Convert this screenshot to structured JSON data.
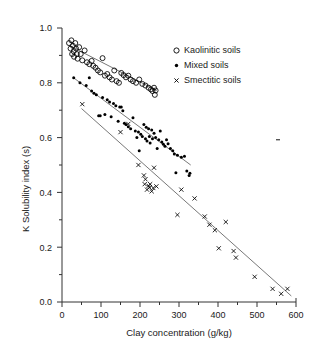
{
  "chart_data": {
    "type": "scatter",
    "title": "",
    "xlabel": "Clay concentration (g/kg)",
    "ylabel": "K Solubility index (s)",
    "xlim": [
      0,
      600
    ],
    "ylim": [
      0.0,
      1.0
    ],
    "xticks": [
      0,
      100,
      200,
      300,
      400,
      500,
      600
    ],
    "xtick_labels": [
      "0",
      "100",
      "200",
      "300",
      "400",
      "500",
      "600"
    ],
    "yticks": [
      0.0,
      0.2,
      0.4,
      0.6,
      0.8,
      1.0
    ],
    "ytick_labels": [
      "0.0",
      "0.2",
      "0.4",
      "0.6",
      "0.8",
      "1.0"
    ],
    "minor_xticks": [
      50,
      150,
      250,
      350,
      450,
      550
    ],
    "minor_yticks": [
      0.1,
      0.3,
      0.5,
      0.7,
      0.9
    ],
    "grid": false,
    "legend_position": "top-right",
    "series": [
      {
        "name": "Kaolinitic soils",
        "marker": "open-circle",
        "color": "#000000",
        "points": [
          [
            18,
            0.945
          ],
          [
            22,
            0.925
          ],
          [
            24,
            0.955
          ],
          [
            26,
            0.905
          ],
          [
            28,
            0.935
          ],
          [
            30,
            0.915
          ],
          [
            31,
            0.895
          ],
          [
            34,
            0.945
          ],
          [
            36,
            0.925
          ],
          [
            38,
            0.905
          ],
          [
            40,
            0.888
          ],
          [
            44,
            0.93
          ],
          [
            48,
            0.905
          ],
          [
            52,
            0.882
          ],
          [
            58,
            0.918
          ],
          [
            64,
            0.875
          ],
          [
            70,
            0.868
          ],
          [
            76,
            0.88
          ],
          [
            80,
            0.862
          ],
          [
            86,
            0.855
          ],
          [
            92,
            0.845
          ],
          [
            98,
            0.838
          ],
          [
            104,
            0.89
          ],
          [
            110,
            0.826
          ],
          [
            116,
            0.832
          ],
          [
            122,
            0.82
          ],
          [
            128,
            0.812
          ],
          [
            134,
            0.845
          ],
          [
            140,
            0.806
          ],
          [
            146,
            0.8
          ],
          [
            152,
            0.836
          ],
          [
            158,
            0.828
          ],
          [
            164,
            0.82
          ],
          [
            170,
            0.826
          ],
          [
            176,
            0.812
          ],
          [
            182,
            0.806
          ],
          [
            190,
            0.8
          ],
          [
            198,
            0.812
          ],
          [
            206,
            0.796
          ],
          [
            214,
            0.79
          ],
          [
            222,
            0.782
          ],
          [
            228,
            0.776
          ],
          [
            232,
            0.77
          ],
          [
            236,
            0.782
          ],
          [
            238,
            0.756
          ],
          [
            240,
            0.772
          ]
        ],
        "fit_line": {
          "x": [
            20,
            243
          ],
          "y": [
            0.935,
            0.772
          ]
        }
      },
      {
        "name": "Mixed soils",
        "marker": "filled-dot",
        "color": "#000000",
        "points": [
          [
            30,
            0.818
          ],
          [
            46,
            0.8
          ],
          [
            62,
            0.79
          ],
          [
            70,
            0.818
          ],
          [
            76,
            0.77
          ],
          [
            82,
            0.762
          ],
          [
            88,
            0.756
          ],
          [
            94,
            0.68
          ],
          [
            98,
            0.68
          ],
          [
            104,
            0.746
          ],
          [
            110,
            0.684
          ],
          [
            116,
            0.738
          ],
          [
            122,
            0.73
          ],
          [
            126,
            0.676
          ],
          [
            132,
            0.724
          ],
          [
            138,
            0.716
          ],
          [
            144,
            0.66
          ],
          [
            148,
            0.712
          ],
          [
            152,
            0.712
          ],
          [
            156,
            0.698
          ],
          [
            160,
            0.652
          ],
          [
            164,
            0.648
          ],
          [
            170,
            0.64
          ],
          [
            176,
            0.632
          ],
          [
            182,
            0.672
          ],
          [
            188,
            0.624
          ],
          [
            192,
            0.6
          ],
          [
            196,
            0.62
          ],
          [
            198,
            0.552
          ],
          [
            202,
            0.612
          ],
          [
            206,
            0.604
          ],
          [
            210,
            0.648
          ],
          [
            214,
            0.596
          ],
          [
            216,
            0.638
          ],
          [
            218,
            0.588
          ],
          [
            222,
            0.632
          ],
          [
            224,
            0.604
          ],
          [
            226,
            0.58
          ],
          [
            230,
            0.628
          ],
          [
            232,
            0.596
          ],
          [
            236,
            0.616
          ],
          [
            240,
            0.6
          ],
          [
            244,
            0.56
          ],
          [
            248,
            0.592
          ],
          [
            252,
            0.624
          ],
          [
            256,
            0.584
          ],
          [
            260,
            0.576
          ],
          [
            264,
            0.568
          ],
          [
            268,
            0.592
          ],
          [
            272,
            0.578
          ],
          [
            278,
            0.56
          ],
          [
            284,
            0.552
          ],
          [
            288,
            0.54
          ],
          [
            292,
            0.472
          ],
          [
            296,
            0.536
          ],
          [
            306,
            0.528
          ],
          [
            314,
            0.532
          ],
          [
            320,
            0.478
          ],
          [
            326,
            0.462
          ],
          [
            328,
            0.47
          ]
        ],
        "fit_line": {
          "x": [
            30,
            330
          ],
          "y": [
            0.818,
            0.5
          ]
        }
      },
      {
        "name": "Smectitic soils",
        "marker": "cross-x",
        "color": "#000000",
        "points": [
          [
            52,
            0.722
          ],
          [
            150,
            0.62
          ],
          [
            170,
            0.65
          ],
          [
            196,
            0.5
          ],
          [
            210,
            0.462
          ],
          [
            212,
            0.43
          ],
          [
            214,
            0.448
          ],
          [
            218,
            0.41
          ],
          [
            222,
            0.424
          ],
          [
            224,
            0.418
          ],
          [
            226,
            0.43
          ],
          [
            230,
            0.404
          ],
          [
            234,
            0.416
          ],
          [
            236,
            0.49
          ],
          [
            242,
            0.422
          ],
          [
            296,
            0.318
          ],
          [
            306,
            0.41
          ],
          [
            340,
            0.378
          ],
          [
            366,
            0.312
          ],
          [
            378,
            0.282
          ],
          [
            392,
            0.262
          ],
          [
            402,
            0.196
          ],
          [
            420,
            0.292
          ],
          [
            440,
            0.186
          ],
          [
            446,
            0.162
          ],
          [
            494,
            0.092
          ],
          [
            540,
            0.048
          ],
          [
            562,
            0.03
          ],
          [
            578,
            0.048
          ]
        ],
        "fit_line": {
          "x": [
            50,
            588
          ],
          "y": [
            0.706,
            0.022
          ]
        }
      }
    ]
  },
  "legend": {
    "items": [
      {
        "label": "Kaolinitic soils",
        "marker": "open-circle"
      },
      {
        "label": "Mixed soils",
        "marker": "filled-dot"
      },
      {
        "label": "Smectitic soils",
        "marker": "cross-x"
      }
    ]
  }
}
